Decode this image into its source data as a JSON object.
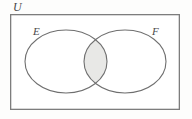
{
  "figure": {
    "type": "venn-diagram",
    "title": "",
    "background_color": "#fdfdfc"
  },
  "labels": {
    "universe": "U",
    "set_left": "E",
    "set_right": "F",
    "text_color": "#4a4a4a"
  },
  "chart_data": {
    "type": "diagram",
    "diagram_kind": "venn",
    "sets": [
      {
        "name": "E",
        "label": "E",
        "shape": "ellipse",
        "cx": 66,
        "cy": 61.5,
        "rx": 41,
        "ry": 31.5,
        "fill": "none",
        "stroke": "#6f6f6f"
      },
      {
        "name": "F",
        "label": "F",
        "shape": "ellipse",
        "cx": 125,
        "cy": 61.5,
        "rx": 41,
        "ry": 31.5,
        "fill": "none",
        "stroke": "#6f6f6f"
      }
    ],
    "universe": {
      "label": "U",
      "shape": "rect",
      "x": 10,
      "y": 14,
      "width": 170,
      "height": 96,
      "fill": "#ffffff",
      "stroke": "#7d7d7d"
    },
    "shaded_regions": [
      {
        "name": "E-intersect-F",
        "expression": "E ∩ F",
        "fill": "#e8e8e6",
        "stroke": "#8a8a8a"
      }
    ]
  },
  "style": {
    "rect_stroke": "#7d7d7d",
    "rect_stroke_width": 1.3,
    "circle_stroke": "#6f6f6f",
    "circle_stroke_width": 1.1,
    "intersection_fill": "#e8e8e6",
    "canvas_fill": "#fdfdfc"
  }
}
